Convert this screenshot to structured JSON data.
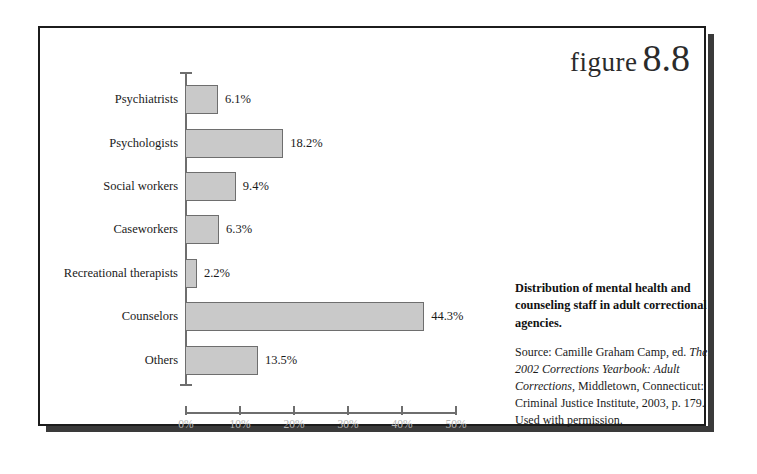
{
  "figure": {
    "word": "figure",
    "number": "8.8"
  },
  "chart_data": {
    "type": "bar",
    "orientation": "horizontal",
    "title": "Distribution of mental health and counseling staff in adult correctional agencies.",
    "xlabel": "",
    "ylabel": "",
    "categories": [
      "Psychiatrists",
      "Psychologists",
      "Social workers",
      "Caseworkers",
      "Recreational therapists",
      "Counselors",
      "Others"
    ],
    "values": [
      6.1,
      18.2,
      9.4,
      6.3,
      2.2,
      44.3,
      13.5
    ],
    "value_labels": [
      "6.1%",
      "18.2%",
      "9.4%",
      "6.3%",
      "2.2%",
      "44.3%",
      "13.5%"
    ],
    "xlim": [
      0,
      50
    ],
    "xticks": [
      0,
      10,
      20,
      30,
      40,
      50
    ],
    "xtick_labels": [
      "0%",
      "10%",
      "20%",
      "30%",
      "40%",
      "50%"
    ],
    "grid": false,
    "legend": null,
    "bar_color": "#c9c9c9",
    "bar_border_color": "#6e6e6e",
    "axis_color": "#6e6e6e",
    "tick_label_color": "#b4b4b4"
  },
  "caption": {
    "title": "Distribution of mental health and counseling staff in adult correctional agencies.",
    "source_prefix": "Source: Camille Graham Camp, ed. ",
    "source_italic_1": "The 2002 Corrections Yearbook: Adult Corrections",
    "source_rest": ", Middletown, Connecticut: Criminal Justice Institute, 2003, p. 179. Used with permission."
  }
}
